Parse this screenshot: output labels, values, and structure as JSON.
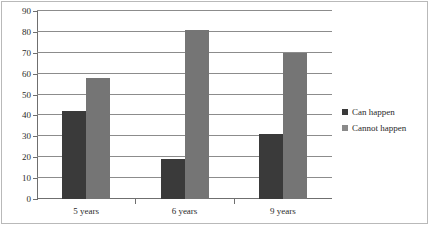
{
  "chart_data": {
    "type": "bar",
    "title": "",
    "subtitle": "",
    "xlabel": "",
    "ylabel": "",
    "categories": [
      "5 years",
      "6 years",
      "9 years"
    ],
    "series": [
      {
        "name": "Can happen",
        "values": [
          42,
          19,
          31
        ],
        "color": "#3a3a3a"
      },
      {
        "name": "Cannot happen",
        "values": [
          58,
          81,
          70
        ],
        "color": "#757575"
      }
    ],
    "ylim": [
      0,
      90
    ],
    "ytick_step": 10,
    "yticks": [
      0,
      10,
      20,
      30,
      40,
      50,
      60,
      70,
      80,
      90
    ],
    "ytick_labels": [
      "0",
      "10",
      "20",
      "30",
      "40",
      "50",
      "60",
      "70",
      "80",
      "90"
    ],
    "grid": true,
    "grid_axis": "y",
    "legend": {
      "position": "right",
      "entries": [
        "Can happen",
        "Cannot happen"
      ]
    },
    "colors": {
      "series_can_happen": "#3a3a3a",
      "series_cannot_happen": "#757575",
      "gridline": "#8c8c8c",
      "axis": "#6f6f6f",
      "frame": "#b9b9b9",
      "text": "#2b2b2b",
      "background": "#ffffff"
    }
  }
}
